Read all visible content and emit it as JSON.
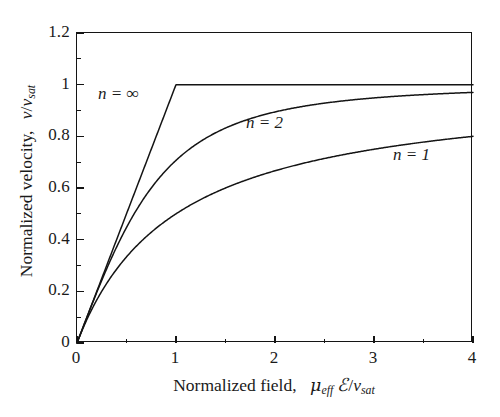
{
  "figure": {
    "background": "#ffffff",
    "line_color": "#141414",
    "axis_color": "#141414"
  },
  "chart_data": {
    "type": "line",
    "title": "",
    "xlabel": "Normalized field,  μ_eff ℰ/v_sat",
    "ylabel": "Normalized velocity,  v/v_sat",
    "xlim": [
      0,
      4
    ],
    "ylim": [
      0,
      1.2
    ],
    "grid": false,
    "legend": "inline-annotations",
    "x_ticks": [
      0,
      1,
      2,
      3,
      4
    ],
    "x_tick_labels": [
      "0",
      "1",
      "2",
      "3",
      "4"
    ],
    "x_minor_ticks": [
      0.5,
      1.5,
      2.5,
      3.5
    ],
    "y_ticks": [
      0,
      0.2,
      0.4,
      0.6,
      0.8,
      1,
      1.2
    ],
    "y_tick_labels": [
      "0",
      "0.2",
      "0.4",
      "0.6",
      "0.8",
      "1",
      "1.2"
    ],
    "y_minor_ticks": [
      0.1,
      0.3,
      0.5,
      0.7,
      0.9,
      1.1
    ],
    "formula": "v/v_sat = x / (1 + x^n)^(1/n)",
    "x": [
      0,
      0.1,
      0.2,
      0.3,
      0.4,
      0.5,
      0.6,
      0.7,
      0.8,
      0.9,
      1,
      1.2,
      1.4,
      1.6,
      1.8,
      2,
      2.25,
      2.5,
      2.75,
      3,
      3.25,
      3.5,
      3.75,
      4
    ],
    "series": [
      {
        "name": "n = 1",
        "label": "n = 1",
        "n": 1,
        "values": [
          0,
          0.091,
          0.167,
          0.231,
          0.286,
          0.333,
          0.375,
          0.412,
          0.444,
          0.474,
          0.5,
          0.545,
          0.583,
          0.615,
          0.643,
          0.667,
          0.692,
          0.714,
          0.733,
          0.75,
          0.765,
          0.778,
          0.789,
          0.8
        ]
      },
      {
        "name": "n = 2",
        "label": "n = 2",
        "n": 2,
        "values": [
          0,
          0.0995,
          0.196,
          0.287,
          0.371,
          0.447,
          0.514,
          0.573,
          0.625,
          0.669,
          0.707,
          0.768,
          0.814,
          0.848,
          0.874,
          0.894,
          0.914,
          0.928,
          0.94,
          0.949,
          0.956,
          0.961,
          0.966,
          0.97
        ]
      },
      {
        "name": "n = ∞",
        "label": "n = ∞",
        "n": "infinity",
        "values": [
          0,
          0.1,
          0.2,
          0.3,
          0.4,
          0.5,
          0.6,
          0.7,
          0.8,
          0.9,
          1,
          1,
          1,
          1,
          1,
          1,
          1,
          1,
          1,
          1,
          1,
          1,
          1,
          1
        ]
      }
    ],
    "annotations": [
      {
        "text": "n = ∞",
        "x": 0.22,
        "y": 1.005
      },
      {
        "text": "n = 2",
        "x": 1.72,
        "y": 0.893
      },
      {
        "text": "n = 1",
        "x": 3.2,
        "y": 0.775
      }
    ]
  },
  "axes": {
    "x_title_parts": {
      "prefix": "Normalized field,",
      "mu": "μ",
      "mu_sub": "eff",
      "field_symbol": "ℰ",
      "slash": "/",
      "v": "v",
      "v_sub": "sat"
    },
    "y_title_parts": {
      "prefix": "Normalized velocity,",
      "v": "v",
      "slash": "/",
      "v2": "v",
      "v2_sub": "sat"
    }
  }
}
